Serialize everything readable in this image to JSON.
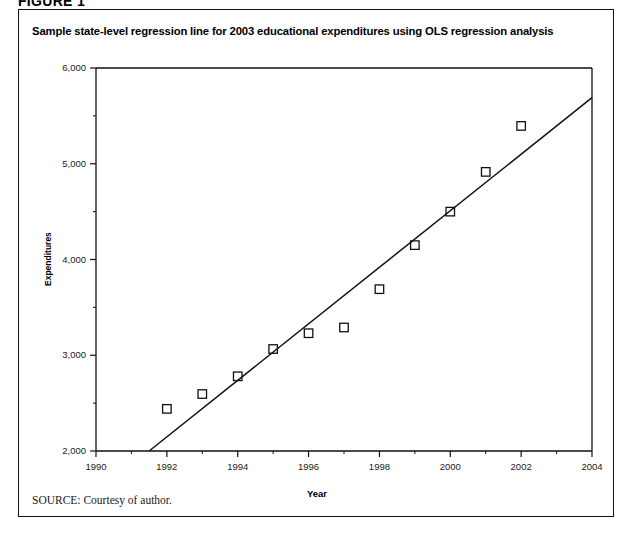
{
  "figure": {
    "number_label": "FIGURE 1",
    "title": "Sample state-level regression line for 2003 educational expenditures using OLS regression analysis",
    "source_label": "SOURCE:",
    "source_text": "Courtesy of author."
  },
  "chart_data": {
    "type": "scatter",
    "title": "Sample state-level regression line for 2003 educational expenditures using OLS regression analysis",
    "xlabel": "Year",
    "ylabel": "Expenditures",
    "xlim": [
      1990,
      2004
    ],
    "ylim": [
      2000,
      6000
    ],
    "grid": false,
    "legend": "none",
    "x_ticks": [
      1990,
      1992,
      1994,
      1996,
      1998,
      2000,
      2002,
      2004
    ],
    "x_tick_labels": [
      "1990",
      "1992",
      "1994",
      "1996",
      "1998",
      "2000",
      "2002",
      "2004"
    ],
    "x_minor_ticks": [
      1991,
      1993,
      1995,
      1997,
      1999,
      2001,
      2003
    ],
    "y_ticks": [
      2000,
      3000,
      4000,
      5000,
      6000
    ],
    "y_tick_labels": [
      "2,000",
      "3,000",
      "4,000",
      "5,000",
      "6,000"
    ],
    "y_minor_ticks": [
      2500,
      3500,
      4500,
      5500
    ],
    "marker": "open-square",
    "marker_color": "#111111",
    "line_color": "#111111",
    "x": [
      1992,
      1993,
      1994,
      1995,
      1996,
      1997,
      1998,
      1999,
      2000,
      2001,
      2002
    ],
    "values": [
      2440,
      2595,
      2780,
      3065,
      3230,
      3290,
      3690,
      4150,
      4500,
      4915,
      5395
    ],
    "points": [
      {
        "year": 1992,
        "expenditures": 2440
      },
      {
        "year": 1993,
        "expenditures": 2595
      },
      {
        "year": 1994,
        "expenditures": 2780
      },
      {
        "year": 1995,
        "expenditures": 3065
      },
      {
        "year": 1996,
        "expenditures": 3230
      },
      {
        "year": 1997,
        "expenditures": 3290
      },
      {
        "year": 1998,
        "expenditures": 3690
      },
      {
        "year": 1999,
        "expenditures": 4150
      },
      {
        "year": 2000,
        "expenditures": 4500
      },
      {
        "year": 2001,
        "expenditures": 4915
      },
      {
        "year": 2002,
        "expenditures": 5395
      }
    ],
    "regression_line": {
      "name": "OLS regression line",
      "x_start": 1991.5,
      "y_start": 2000,
      "x_end": 2004,
      "y_end": 5690
    }
  },
  "colors": {
    "frame": "#111111",
    "axis": "#111111",
    "text": "#000000",
    "background": "#ffffff"
  }
}
